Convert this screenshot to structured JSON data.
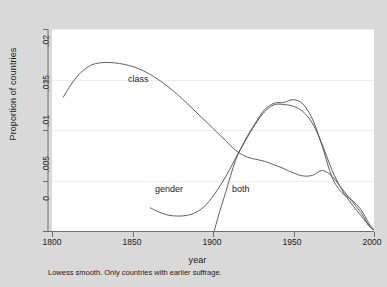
{
  "chart_data": {
    "type": "line",
    "title": "",
    "subtitle": "",
    "caption": "Lowess smooth. Only countries with earlier suffrage.",
    "xlabel": "year",
    "ylabel": "Proportion of countries",
    "xlim": [
      1800,
      2000
    ],
    "ylim": [
      0,
      0.02
    ],
    "xticks": [
      1800,
      1850,
      1900,
      1950,
      2000
    ],
    "xtick_labels": [
      "1800",
      "1850",
      "1900",
      "1950",
      "2000"
    ],
    "yticks": [
      0,
      0.005,
      0.01,
      0.015,
      0.02
    ],
    "ytick_labels": [
      "0",
      ".005",
      ".01",
      ".015",
      ".02"
    ],
    "grid": "horizontal",
    "legend_position": "inline-annotations",
    "line_color": "#4d4d4d",
    "plot_background": "#ffffff",
    "figure_background": "#d9d9d9",
    "annotations": [
      {
        "name": "class",
        "text": "class",
        "x": 1862,
        "y": 0.0168
      },
      {
        "name": "gender",
        "text": "gender",
        "x": 1893,
        "y": 0.0035
      },
      {
        "name": "both",
        "text": "both",
        "x": 1934,
        "y": 0.0035
      }
    ],
    "series": [
      {
        "name": "class",
        "label": "class",
        "x": [
          1807,
          1812,
          1818,
          1824,
          1830,
          1836,
          1842,
          1848,
          1854,
          1860,
          1866,
          1872,
          1878,
          1884,
          1890,
          1896,
          1902,
          1908,
          1914,
          1920,
          1926,
          1932,
          1938,
          1944,
          1950,
          1956,
          1962,
          1968,
          1974,
          1980,
          1986,
          1992,
          1997,
          2000
        ],
        "y": [
          0.01325,
          0.01455,
          0.0157,
          0.0164,
          0.01665,
          0.01668,
          0.01658,
          0.01638,
          0.01605,
          0.0156,
          0.015,
          0.0143,
          0.0135,
          0.01262,
          0.0117,
          0.01078,
          0.00985,
          0.00893,
          0.008,
          0.0074,
          0.00712,
          0.0069,
          0.00655,
          0.00618,
          0.00575,
          0.00545,
          0.00552,
          0.006,
          0.0054,
          0.0042,
          0.003,
          0.0018,
          0.0005,
          0.0001
        ]
      },
      {
        "name": "gender",
        "label": "gender",
        "x": [
          1861,
          1866,
          1872,
          1878,
          1884,
          1890,
          1896,
          1902,
          1908,
          1914,
          1920,
          1926,
          1932,
          1938,
          1944,
          1950,
          1956,
          1962,
          1968,
          1974,
          1980,
          1986,
          1992,
          1997,
          2000
        ],
        "y": [
          0.0023,
          0.0019,
          0.00158,
          0.00148,
          0.00155,
          0.0019,
          0.00265,
          0.0039,
          0.0054,
          0.0072,
          0.0089,
          0.0105,
          0.0118,
          0.0125,
          0.01252,
          0.01235,
          0.0118,
          0.0106,
          0.0085,
          0.006,
          0.0041,
          0.0027,
          0.0015,
          0.0005,
          0.0001
        ]
      },
      {
        "name": "both",
        "label": "both",
        "x": [
          1899,
          1903,
          1908,
          1914,
          1920,
          1926,
          1932,
          1938,
          1944,
          1950,
          1956,
          1962,
          1968,
          1974,
          1980,
          1986,
          1992,
          1997,
          2000
        ],
        "y": [
          -0.0011,
          0.0013,
          0.0039,
          0.007,
          0.009,
          0.0106,
          0.012,
          0.01265,
          0.01272,
          0.013,
          0.01255,
          0.011,
          0.0083,
          0.0053,
          0.0038,
          0.0031,
          0.0021,
          0.0007,
          0.0001
        ]
      }
    ]
  }
}
